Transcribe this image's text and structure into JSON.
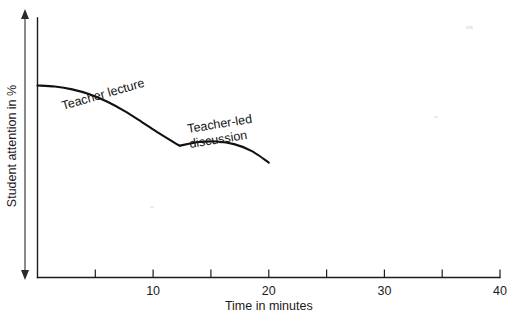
{
  "figure": {
    "name": "student-attention-over-time",
    "background_color": "#ffffff",
    "ink_color": "#111111"
  },
  "chart_data": {
    "type": "line",
    "title": "",
    "subtitle": "",
    "xlabel": "Time in minutes",
    "ylabel": "Student attention in %",
    "xlim": [
      0,
      40
    ],
    "ylim": [
      0,
      100
    ],
    "grid": false,
    "legend_position": "inline-annotations",
    "x_ticks": [
      0,
      5,
      10,
      15,
      20,
      25,
      30,
      35,
      40
    ],
    "x_tick_labels": [
      "",
      "",
      "10",
      "",
      "20",
      "",
      "30",
      "",
      "40"
    ],
    "y_ticks": [],
    "y_tick_labels": [],
    "annotations": [
      {
        "id": "teacher-lecture",
        "text": "Teacher lecture",
        "x": 5.5,
        "y": 78,
        "rotation_deg": -16
      },
      {
        "id": "teacher-led-discussion",
        "line1": "Teacher-led",
        "line2": "discussion",
        "x": 16,
        "y": 66,
        "rotation_deg": -9
      }
    ],
    "series": [
      {
        "name": "Teacher lecture",
        "x": [
          0,
          1.5,
          3,
          4.5,
          6,
          7.5,
          9,
          10.5,
          12,
          12.3
        ],
        "y": [
          74,
          73.6,
          72.5,
          70.6,
          67.8,
          64.2,
          60,
          55.6,
          51.5,
          50.8
        ]
      },
      {
        "name": "Teacher-led discussion",
        "x": [
          12.3,
          14,
          15.5,
          17,
          18.5,
          20
        ],
        "y": [
          50.8,
          52.2,
          52.4,
          51.4,
          48.8,
          44.3
        ]
      }
    ]
  },
  "axes": {
    "y_axis": {
      "name": "y-axis",
      "arrow_top": true,
      "arrow_bottom": true
    },
    "x_axis": {
      "name": "x-axis",
      "tick_direction": "up"
    }
  }
}
